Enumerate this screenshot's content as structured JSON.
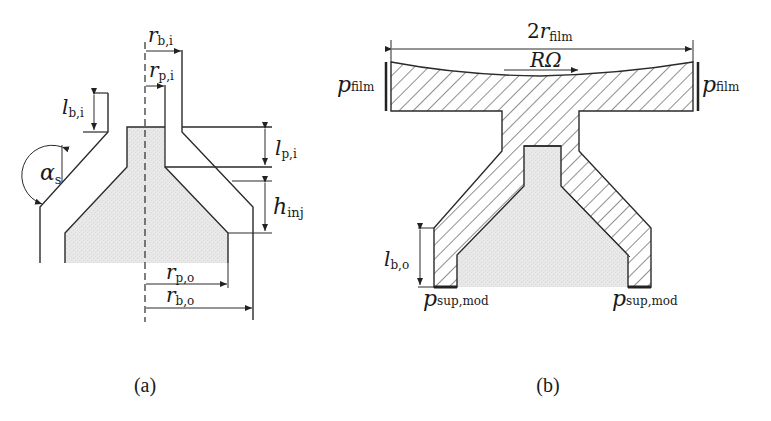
{
  "figure": {
    "panels": [
      {
        "id": "a",
        "caption": "(a)",
        "labels": {
          "r_bi_main": "r",
          "r_bi_sub": "b,i",
          "r_pi_main": "r",
          "r_pi_sub": "p,i",
          "l_bi_main": "l",
          "l_bi_sub": "b,i",
          "alpha_main": "α",
          "alpha_sub": "s",
          "l_pi_main": "l",
          "l_pi_sub": "p,i",
          "h_inj_main": "h",
          "h_inj_sub": "inj",
          "r_po_main": "r",
          "r_po_sub": "p,o",
          "r_bo_main": "r",
          "r_bo_sub": "b,o"
        }
      },
      {
        "id": "b",
        "caption": "(b)",
        "labels": {
          "r_film_prefix": "2",
          "r_film_main": "r",
          "r_film_sub": "film",
          "rotation": "RΩ",
          "p_film_left_main": "p",
          "p_film_left_sub": "film",
          "p_film_right_main": "p",
          "p_film_right_sub": "film",
          "l_bo_main": "l",
          "l_bo_sub": "b,o",
          "p_sup_left_main": "p",
          "p_sup_left_sub": "sup,mod",
          "p_sup_right_main": "p",
          "p_sup_right_sub": "sup,mod"
        }
      }
    ],
    "colors": {
      "line": "#2a2a2a",
      "poppet_fill": "#e6e6e6",
      "hatch": "#333333"
    }
  }
}
